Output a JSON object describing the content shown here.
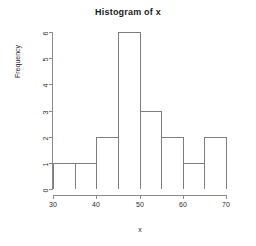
{
  "chart_data": {
    "type": "bar",
    "title": "Histogram of x",
    "xlabel": "x",
    "ylabel": "Frequency",
    "categories": [
      "30-35",
      "35-40",
      "40-45",
      "45-50",
      "50-55",
      "55-60",
      "60-65",
      "65-70"
    ],
    "bin_edges": [
      30,
      35,
      40,
      45,
      50,
      55,
      60,
      65,
      70
    ],
    "bin_width": 5,
    "values": [
      1,
      1,
      2,
      6,
      3,
      2,
      1,
      2
    ],
    "xlim": [
      30,
      70
    ],
    "ylim": [
      0,
      6
    ],
    "xticks": [
      30,
      40,
      50,
      60,
      70
    ],
    "xtick_labels": [
      "30",
      "40",
      "50",
      "60",
      "70"
    ],
    "yticks": [
      0,
      1,
      2,
      3,
      4,
      5,
      6
    ],
    "ytick_labels": [
      "0",
      "1",
      "2",
      "3",
      "4",
      "5",
      "6"
    ],
    "grid": false,
    "legend": false,
    "bar_fill": "#ffffff",
    "bar_border": "#7d7d7d",
    "axis_color": "#8a8a8a",
    "background": "#ffffff"
  }
}
